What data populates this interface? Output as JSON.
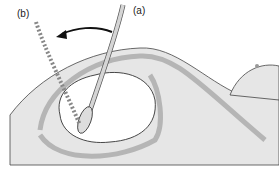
{
  "figure": {
    "labels": {
      "a": "(a)",
      "b": "(b)"
    },
    "colors": {
      "skin": "#e4e4e4",
      "uterus_wall": "#b9b9b9",
      "outline": "#333333",
      "fetus": "#ffffff",
      "instrument": "#d0d0d0"
    }
  }
}
